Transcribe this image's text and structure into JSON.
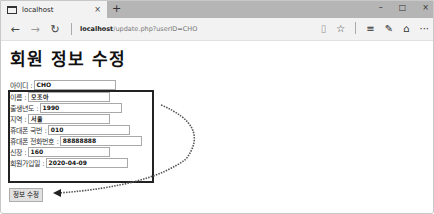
{
  "browser": {
    "tab_title": "localhost",
    "tab_close": "×",
    "new_tab": "+",
    "window_controls": {
      "minimize": "–",
      "maximize": "□",
      "close": "×"
    },
    "nav": {
      "back": "←",
      "forward": "→",
      "refresh": "↻"
    },
    "address": {
      "host": "localhost",
      "path": "/update.php?userID=CHO"
    },
    "toolbar_icons": {
      "reading_view": "▯",
      "favorite": "☆",
      "hub": "≡",
      "notes": "✎",
      "share": "⌂",
      "more": "···"
    }
  },
  "page": {
    "title": "회원 정보 수정",
    "fields": [
      {
        "label": "아이디 :",
        "value": "CHO"
      },
      {
        "label": "이름 :",
        "value": "모조아"
      },
      {
        "label": "출생년도 :",
        "value": "1990"
      },
      {
        "label": "지역 :",
        "value": "서울"
      },
      {
        "label": "휴대폰 국번 :",
        "value": "010"
      },
      {
        "label": "휴대폰 전화번호 :",
        "value": "88888888"
      },
      {
        "label": "신장 :",
        "value": "160"
      },
      {
        "label": "회원가입일 :",
        "value": "2020-04-09"
      }
    ],
    "submit_label": "정보 수정"
  }
}
